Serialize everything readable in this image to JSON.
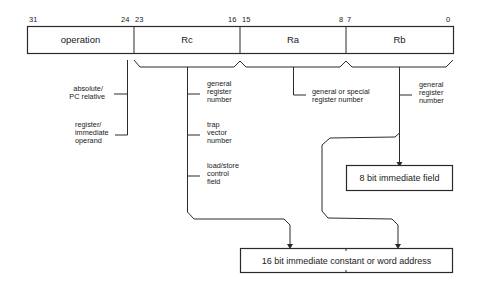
{
  "diagram": {
    "title": "",
    "instruction_format": {
      "fields": [
        {
          "name": "operation",
          "bit_high": "31",
          "bit_low": "24"
        },
        {
          "name": "Rc",
          "bit_high": "23",
          "bit_low": "16"
        },
        {
          "name": "Ra",
          "bit_high": "15",
          "bit_low": "8"
        },
        {
          "name": "Rb",
          "bit_high": "7",
          "bit_low": "0"
        }
      ]
    },
    "annotations": {
      "operation": [
        {
          "lines": [
            "absolute/",
            "PC relative"
          ]
        },
        {
          "lines": [
            "register/",
            "immediate",
            "operand"
          ]
        }
      ],
      "rc": [
        {
          "lines": [
            "general",
            "register",
            "number"
          ]
        },
        {
          "lines": [
            "trap",
            "vector",
            "number"
          ]
        },
        {
          "lines": [
            "load/store",
            "control",
            "field"
          ]
        }
      ],
      "ra": [
        {
          "lines": [
            "general or special",
            "register number"
          ]
        }
      ],
      "rb": [
        {
          "lines": [
            "general",
            "register",
            "number"
          ]
        }
      ]
    },
    "targets": {
      "imm8": "8 bit immediate field",
      "imm16": "16 bit immediate constant or word address"
    }
  }
}
